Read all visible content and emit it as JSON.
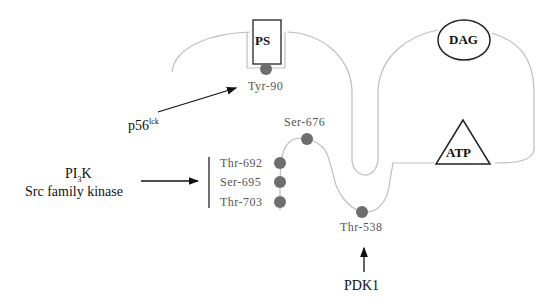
{
  "diagram": {
    "domains": {
      "ps": "PS",
      "dag": "DAG",
      "atp": "ATP"
    },
    "sites": {
      "tyr90": "Tyr-90",
      "ser676": "Ser-676",
      "thr692": "Thr-692",
      "ser695": "Ser-695",
      "thr703": "Thr-703",
      "thr538": "Thr-538"
    },
    "kinases": {
      "p56": "p56",
      "p56_sup": "lck",
      "pi3k_prefix": "PI",
      "pi3k_sub": "3",
      "pi3k_suffix": "K",
      "src": "Src family kinase",
      "pdk1": "PDK1"
    },
    "colors": {
      "line": "#bdbdbd",
      "dot": "#6e6e6e",
      "outline": "#222222"
    }
  }
}
